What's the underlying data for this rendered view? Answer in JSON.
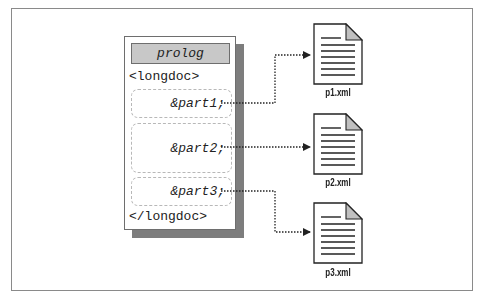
{
  "diagram": {
    "document": {
      "prolog": "prolog",
      "open_tag": "<longdoc>",
      "close_tag": "</longdoc>",
      "entities": [
        {
          "ref": "&part1;",
          "target": "p1.xml"
        },
        {
          "ref": "&part2;",
          "target": "p2.xml"
        },
        {
          "ref": "&part3;",
          "target": "p3.xml"
        }
      ]
    },
    "files": [
      {
        "label": "p1.xml"
      },
      {
        "label": "p2.xml"
      },
      {
        "label": "p3.xml"
      }
    ],
    "colors": {
      "frame_border": "#8a8a8a",
      "prolog_fill": "#c8c8c8",
      "shadow": "#7d7d7d",
      "line": "#222222",
      "fold_fill": "#c0c0c0"
    }
  }
}
